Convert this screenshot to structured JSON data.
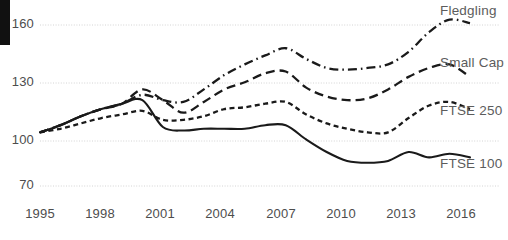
{
  "chart_data": {
    "type": "line",
    "title": "",
    "subtitle": "",
    "xlabel": "",
    "ylabel": "",
    "grid": true,
    "legend_position": "right-inline",
    "xlim": [
      1995,
      2016
    ],
    "ylim": [
      70,
      170
    ],
    "yticks": [
      70,
      100,
      130,
      160
    ],
    "ytick_labels": [
      "70",
      "100",
      "130",
      "160"
    ],
    "xticks": [
      1995,
      1998,
      2001,
      2004,
      2007,
      2010,
      2013,
      2016
    ],
    "xtick_labels": [
      "1995",
      "1998",
      "2001",
      "2004",
      "2007",
      "2010",
      "2013",
      "2016"
    ],
    "x": [
      1995,
      1996,
      1997,
      1998,
      1999,
      2000,
      2001,
      2002,
      2003,
      2004,
      2005,
      2006,
      2007,
      2008,
      2009,
      2010,
      2011,
      2012,
      2013,
      2014,
      2015,
      2016
    ],
    "series": [
      {
        "name": "Fledgling",
        "style": "dash-dot",
        "color": "#1a1a1a",
        "values": [
          100,
          104,
          109,
          113,
          116,
          121,
          118,
          117,
          124,
          132,
          138,
          143,
          147,
          141,
          136,
          135,
          136,
          138,
          145,
          156,
          163,
          161
        ]
      },
      {
        "name": "Small Cap",
        "style": "dashed-long",
        "color": "#1a1a1a",
        "values": [
          100,
          104,
          109,
          113,
          116,
          124,
          118,
          111,
          117,
          124,
          128,
          133,
          134,
          125,
          120,
          118,
          119,
          124,
          131,
          136,
          138,
          131
        ]
      },
      {
        "name": "FTSE 250",
        "style": "dashed-short",
        "color": "#1a1a1a",
        "values": [
          100,
          102,
          105,
          108,
          110,
          112,
          107,
          107,
          109,
          113,
          114,
          116,
          117,
          110,
          105,
          102,
          100,
          100,
          108,
          115,
          117,
          113
        ]
      },
      {
        "name": "FTSE 100",
        "style": "solid",
        "color": "#1a1a1a",
        "values": [
          100,
          104,
          109,
          113,
          116,
          118,
          103,
          101,
          102,
          102,
          102,
          104,
          104,
          96,
          89,
          84,
          83,
          84,
          89,
          86,
          88,
          86
        ]
      }
    ]
  },
  "series_labels": [
    {
      "text": "Fledgling",
      "x": 440,
      "y": 3
    },
    {
      "text": "Small Cap",
      "x": 440,
      "y": 55
    },
    {
      "text": "FTSE 250",
      "x": 440,
      "y": 103
    },
    {
      "text": "FTSE 100",
      "x": 440,
      "y": 156
    }
  ],
  "axes": {
    "ytick_positions": [
      {
        "label": "160",
        "y": 25
      },
      {
        "label": "130",
        "y": 83
      },
      {
        "label": "100",
        "y": 141
      },
      {
        "label": "70",
        "y": 186
      }
    ],
    "xtick_positions": [
      {
        "label": "1995",
        "x": 40
      },
      {
        "label": "1998",
        "x": 100
      },
      {
        "label": "2001",
        "x": 160
      },
      {
        "label": "2004",
        "x": 220
      },
      {
        "label": "2007",
        "x": 281
      },
      {
        "label": "2010",
        "x": 341
      },
      {
        "label": "2013",
        "x": 401
      },
      {
        "label": "2016",
        "x": 461
      }
    ]
  }
}
